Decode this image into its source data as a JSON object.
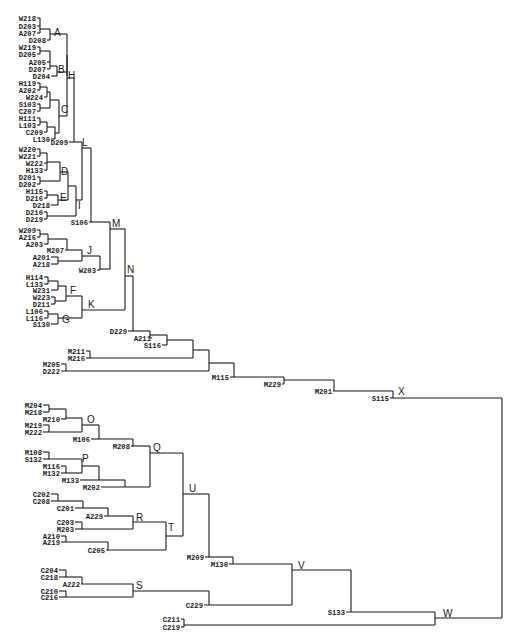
{
  "figure": {
    "type": "dendrogram",
    "orientation": "left-to-right",
    "root": "W"
  },
  "leaves": [
    {
      "id": "W218",
      "x": 36,
      "y": 18
    },
    {
      "id": "D203",
      "x": 36,
      "y": 26
    },
    {
      "id": "A207",
      "x": 36,
      "y": 33
    },
    {
      "id": "D208",
      "x": 46,
      "y": 40
    },
    {
      "id": "W219",
      "x": 36,
      "y": 47
    },
    {
      "id": "D205",
      "x": 36,
      "y": 54
    },
    {
      "id": "A205",
      "x": 46,
      "y": 62
    },
    {
      "id": "D207",
      "x": 46,
      "y": 69
    },
    {
      "id": "D204",
      "x": 50,
      "y": 76
    },
    {
      "id": "H119",
      "x": 36,
      "y": 83
    },
    {
      "id": "A202",
      "x": 36,
      "y": 90
    },
    {
      "id": "W224",
      "x": 43,
      "y": 97
    },
    {
      "id": "S103",
      "x": 36,
      "y": 104
    },
    {
      "id": "C207",
      "x": 36,
      "y": 111
    },
    {
      "id": "H111",
      "x": 36,
      "y": 118
    },
    {
      "id": "L103",
      "x": 36,
      "y": 125
    },
    {
      "id": "C209",
      "x": 43,
      "y": 132
    },
    {
      "id": "L130",
      "x": 50,
      "y": 139
    },
    {
      "id": "D209",
      "x": 68,
      "y": 142
    },
    {
      "id": "W220",
      "x": 36,
      "y": 149
    },
    {
      "id": "W221",
      "x": 36,
      "y": 156
    },
    {
      "id": "W222",
      "x": 43,
      "y": 163
    },
    {
      "id": "H133",
      "x": 43,
      "y": 170
    },
    {
      "id": "D201",
      "x": 36,
      "y": 177
    },
    {
      "id": "D202",
      "x": 36,
      "y": 184
    },
    {
      "id": "H115",
      "x": 43,
      "y": 191
    },
    {
      "id": "D216",
      "x": 43,
      "y": 198
    },
    {
      "id": "D218",
      "x": 50,
      "y": 205
    },
    {
      "id": "D210",
      "x": 43,
      "y": 212
    },
    {
      "id": "D219",
      "x": 43,
      "y": 219
    },
    {
      "id": "S106",
      "x": 88,
      "y": 222
    },
    {
      "id": "W209",
      "x": 36,
      "y": 230
    },
    {
      "id": "A216",
      "x": 36,
      "y": 237
    },
    {
      "id": "A203",
      "x": 43,
      "y": 244
    },
    {
      "id": "M207",
      "x": 64,
      "y": 250
    },
    {
      "id": "A201",
      "x": 50,
      "y": 257
    },
    {
      "id": "A218",
      "x": 50,
      "y": 264
    },
    {
      "id": "W203",
      "x": 96,
      "y": 270
    },
    {
      "id": "H114",
      "x": 43,
      "y": 277
    },
    {
      "id": "L133",
      "x": 43,
      "y": 284
    },
    {
      "id": "W231",
      "x": 50,
      "y": 290
    },
    {
      "id": "W223",
      "x": 50,
      "y": 297
    },
    {
      "id": "D211",
      "x": 50,
      "y": 304
    },
    {
      "id": "L106",
      "x": 43,
      "y": 311
    },
    {
      "id": "L116",
      "x": 43,
      "y": 318
    },
    {
      "id": "S130",
      "x": 50,
      "y": 324
    },
    {
      "id": "D229",
      "x": 127,
      "y": 331
    },
    {
      "id": "A211",
      "x": 151,
      "y": 338
    },
    {
      "id": "S116",
      "x": 161,
      "y": 345
    },
    {
      "id": "M211",
      "x": 85,
      "y": 351
    },
    {
      "id": "M216",
      "x": 85,
      "y": 358
    },
    {
      "id": "M205",
      "x": 60,
      "y": 364
    },
    {
      "id": "D222",
      "x": 60,
      "y": 371
    },
    {
      "id": "M115",
      "x": 229,
      "y": 377
    },
    {
      "id": "M229",
      "x": 281,
      "y": 384
    },
    {
      "id": "M201",
      "x": 332,
      "y": 391
    },
    {
      "id": "S115",
      "x": 389,
      "y": 398
    },
    {
      "id": "M204",
      "x": 42,
      "y": 405
    },
    {
      "id": "M218",
      "x": 42,
      "y": 412
    },
    {
      "id": "M210",
      "x": 60,
      "y": 419
    },
    {
      "id": "M219",
      "x": 42,
      "y": 425
    },
    {
      "id": "M222",
      "x": 42,
      "y": 432
    },
    {
      "id": "M106",
      "x": 90,
      "y": 439
    },
    {
      "id": "M208",
      "x": 130,
      "y": 446
    },
    {
      "id": "M108",
      "x": 42,
      "y": 452
    },
    {
      "id": "S132",
      "x": 42,
      "y": 459
    },
    {
      "id": "M116",
      "x": 60,
      "y": 466
    },
    {
      "id": "M132",
      "x": 60,
      "y": 473
    },
    {
      "id": "M133",
      "x": 79,
      "y": 480
    },
    {
      "id": "M202",
      "x": 100,
      "y": 487
    },
    {
      "id": "C202",
      "x": 50,
      "y": 494
    },
    {
      "id": "C208",
      "x": 50,
      "y": 501
    },
    {
      "id": "C201",
      "x": 74,
      "y": 508
    },
    {
      "id": "A229",
      "x": 103,
      "y": 516
    },
    {
      "id": "C203",
      "x": 74,
      "y": 522
    },
    {
      "id": "M203",
      "x": 74,
      "y": 529
    },
    {
      "id": "A210",
      "x": 60,
      "y": 536
    },
    {
      "id": "A219",
      "x": 60,
      "y": 542
    },
    {
      "id": "C205",
      "x": 105,
      "y": 550
    },
    {
      "id": "M209",
      "x": 204,
      "y": 557
    },
    {
      "id": "M130",
      "x": 228,
      "y": 564
    },
    {
      "id": "C204",
      "x": 58,
      "y": 570
    },
    {
      "id": "C218",
      "x": 58,
      "y": 577
    },
    {
      "id": "A222",
      "x": 80,
      "y": 584
    },
    {
      "id": "C210",
      "x": 58,
      "y": 591
    },
    {
      "id": "C216",
      "x": 58,
      "y": 597
    },
    {
      "id": "C229",
      "x": 203,
      "y": 605
    },
    {
      "id": "S133",
      "x": 345,
      "y": 612
    },
    {
      "id": "C211",
      "x": 180,
      "y": 619
    },
    {
      "id": "C219",
      "x": 180,
      "y": 627
    }
  ],
  "cluster_labels": [
    {
      "id": "A",
      "x": 54,
      "y": 36
    },
    {
      "id": "B",
      "x": 58,
      "y": 73
    },
    {
      "id": "H",
      "x": 68,
      "y": 79
    },
    {
      "id": "C",
      "x": 61,
      "y": 113
    },
    {
      "id": "L",
      "x": 82,
      "y": 146
    },
    {
      "id": "D",
      "x": 61,
      "y": 175
    },
    {
      "id": "E",
      "x": 60,
      "y": 201
    },
    {
      "id": "I",
      "x": 78,
      "y": 209
    },
    {
      "id": "M",
      "x": 112,
      "y": 227
    },
    {
      "id": "J",
      "x": 87,
      "y": 254
    },
    {
      "id": "N",
      "x": 127,
      "y": 273
    },
    {
      "id": "F",
      "x": 70,
      "y": 294
    },
    {
      "id": "K",
      "x": 88,
      "y": 308
    },
    {
      "id": "G",
      "x": 62,
      "y": 323
    },
    {
      "id": "X",
      "x": 398,
      "y": 395
    },
    {
      "id": "O",
      "x": 87,
      "y": 423
    },
    {
      "id": "Q",
      "x": 153,
      "y": 451
    },
    {
      "id": "P",
      "x": 82,
      "y": 462
    },
    {
      "id": "U",
      "x": 189,
      "y": 492
    },
    {
      "id": "R",
      "x": 136,
      "y": 521
    },
    {
      "id": "T",
      "x": 168,
      "y": 531
    },
    {
      "id": "V",
      "x": 298,
      "y": 569
    },
    {
      "id": "S",
      "x": 136,
      "y": 589
    },
    {
      "id": "W",
      "x": 443,
      "y": 617
    }
  ]
}
